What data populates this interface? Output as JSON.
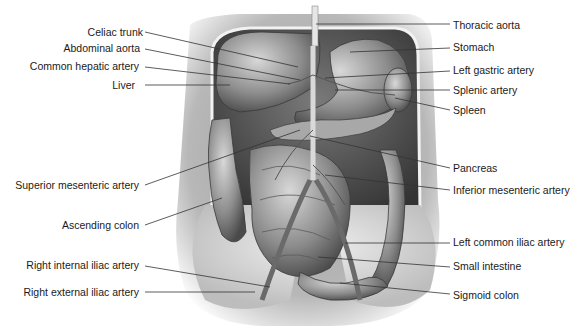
{
  "diagram": {
    "colors": {
      "background": "#ffffff",
      "text": "#1a1a1a",
      "leader_line": "#333333",
      "organ_dark": "#4a4a4a",
      "organ_mid": "#8a8a8a",
      "organ_light": "#c8c8c8"
    },
    "labels_left": [
      {
        "text": "Celiac trunk",
        "x": 143,
        "y": 26,
        "line": [
          145,
          32,
          298,
          67
        ]
      },
      {
        "text": "Abdominal aorta",
        "x": 140,
        "y": 42,
        "line": [
          145,
          49,
          300,
          80
        ]
      },
      {
        "text": "Common hepatic artery",
        "x": 139,
        "y": 60,
        "line": [
          145,
          67,
          290,
          84
        ]
      },
      {
        "text": "Liver",
        "x": 135,
        "y": 79,
        "line": [
          145,
          85,
          230,
          85
        ]
      },
      {
        "text": "Superior mesenteric artery",
        "x": 139,
        "y": 179,
        "line": [
          145,
          185,
          300,
          130
        ]
      },
      {
        "text": "Ascending colon",
        "x": 139,
        "y": 219,
        "line": [
          145,
          225,
          222,
          198
        ]
      },
      {
        "text": "Right internal iliac artery",
        "x": 139,
        "y": 259,
        "line": [
          145,
          266,
          270,
          287
        ]
      },
      {
        "text": "Right external iliac artery",
        "x": 139,
        "y": 286,
        "line": [
          145,
          292,
          255,
          292
        ]
      }
    ],
    "labels_right": [
      {
        "text": "Thoracic aorta",
        "x": 453,
        "y": 19,
        "line": [
          316,
          24,
          450,
          24
        ]
      },
      {
        "text": "Stomach",
        "x": 453,
        "y": 41,
        "line": [
          350,
          52,
          450,
          48
        ]
      },
      {
        "text": "Left gastric artery",
        "x": 453,
        "y": 64,
        "line": [
          325,
          78,
          450,
          71
        ]
      },
      {
        "text": "Splenic artery",
        "x": 453,
        "y": 84,
        "line": [
          335,
          90,
          450,
          90
        ]
      },
      {
        "text": "Spleen",
        "x": 453,
        "y": 104,
        "line": [
          395,
          98,
          450,
          110
        ]
      },
      {
        "text": "Pancreas",
        "x": 453,
        "y": 162,
        "line": [
          310,
          136,
          450,
          168
        ]
      },
      {
        "text": "Inferior mesenteric artery",
        "x": 453,
        "y": 184,
        "line": [
          325,
          175,
          450,
          190
        ]
      },
      {
        "text": "Left common iliac artery",
        "x": 453,
        "y": 236,
        "line": [
          345,
          243,
          450,
          243
        ]
      },
      {
        "text": "Small intestine",
        "x": 453,
        "y": 260,
        "line": [
          318,
          257,
          450,
          267
        ]
      },
      {
        "text": "Sigmoid colon",
        "x": 453,
        "y": 289,
        "line": [
          340,
          283,
          450,
          294
        ]
      }
    ]
  }
}
